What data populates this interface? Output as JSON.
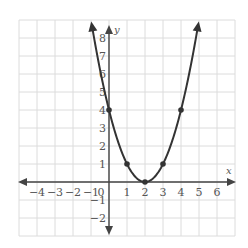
{
  "chart_data": {
    "type": "line",
    "title": "",
    "function": "y = (x - 2)^2",
    "xlabel": "x",
    "ylabel": "y",
    "xlim": [
      -5,
      7
    ],
    "ylim": [
      -3,
      9
    ],
    "grid": true,
    "x_ticks": [
      -4,
      -3,
      -2,
      -1,
      0,
      1,
      2,
      3,
      4,
      5,
      6
    ],
    "y_ticks": [
      -2,
      -1,
      1,
      2,
      3,
      4,
      5,
      6,
      7,
      8
    ],
    "x_tick_labels": [
      "−4",
      "−3",
      "−2",
      "−1",
      "0",
      "1",
      "2",
      "3",
      "4",
      "5",
      "6"
    ],
    "y_tick_labels": [
      "−2",
      "−1",
      "1",
      "2",
      "3",
      "4",
      "5",
      "6",
      "7",
      "8"
    ],
    "series": [
      {
        "name": "parabola",
        "points": [
          [
            0,
            4
          ],
          [
            1,
            1
          ],
          [
            2,
            0
          ],
          [
            3,
            1
          ],
          [
            4,
            4
          ]
        ],
        "x_range": [
          -0.95,
          4.95
        ],
        "color": "#333333"
      }
    ],
    "colors": {
      "grid": "#dcdcdc",
      "axis": "#444444",
      "curve": "#333333",
      "text": "#555555"
    }
  }
}
